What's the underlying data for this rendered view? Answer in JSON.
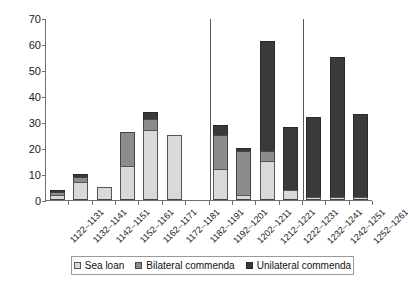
{
  "chart_data": {
    "type": "bar",
    "title": "",
    "subtitle": "",
    "xlabel": "",
    "ylabel": "",
    "stacked": true,
    "grid": false,
    "legend_position": "bottom",
    "ylim": [
      0,
      70
    ],
    "yticks": [
      0,
      10,
      20,
      30,
      40,
      50,
      60,
      70
    ],
    "ytick_labels": [
      "0",
      "10",
      "20",
      "30",
      "40",
      "50",
      "60",
      "70"
    ],
    "categories": [
      "1122–1131",
      "1132–1141",
      "1142–1151",
      "1152–1161",
      "1162–1171",
      "1172–1181",
      "1182–1191",
      "1192–1201",
      "1202–1211",
      "1212–1221",
      "1222–1231",
      "1232–1241",
      "1242–1251",
      "1252–1261"
    ],
    "series": [
      {
        "name": "Sea loan",
        "color": "#d9d9d9",
        "values": [
          2,
          7,
          5,
          13,
          27,
          25,
          0,
          12,
          2,
          15,
          4,
          1,
          1,
          1
        ]
      },
      {
        "name": "Bilateral commenda",
        "color": "#8c8c8c",
        "values": [
          1,
          2,
          0,
          13,
          4,
          0,
          0,
          13,
          17,
          4,
          0,
          0,
          0,
          0
        ]
      },
      {
        "name": "Unilateral commenda",
        "color": "#3a3a3a",
        "values": [
          1,
          1,
          0,
          0,
          3,
          0,
          0,
          4,
          1,
          42,
          24,
          31,
          54,
          32
        ]
      }
    ],
    "totals": [
      4,
      10,
      5,
      26,
      34,
      25,
      0,
      29,
      20,
      61,
      28,
      32,
      55,
      33
    ],
    "annotations": [
      {
        "type": "vertical-divider",
        "after_category": "1182–1191"
      },
      {
        "type": "vertical-divider",
        "after_category": "1222–1231"
      }
    ]
  },
  "legend": {
    "items": [
      {
        "label": "Sea loan"
      },
      {
        "label": "Bilateral commenda"
      },
      {
        "label": "Unilateral commenda"
      }
    ]
  }
}
